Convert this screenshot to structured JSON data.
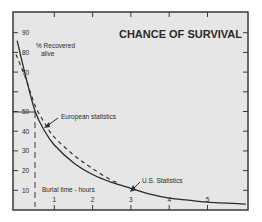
{
  "chart_data": {
    "type": "line",
    "title": "CHANCE OF SURVIVAL",
    "xlabel": "Burial time - hours",
    "ylabel": "% Recovered alive",
    "ylabel_lines": [
      "% Recovered",
      "alive"
    ],
    "xlim": [
      0,
      6
    ],
    "ylim": [
      0,
      100
    ],
    "x_ticks": [
      1,
      2,
      3,
      4,
      5
    ],
    "y_ticks": [
      10,
      20,
      30,
      40,
      50,
      70,
      80,
      90
    ],
    "y_tick_marks": [
      10,
      20,
      30,
      40,
      50,
      60,
      70,
      80,
      90
    ],
    "grid": false,
    "legend_position": "inline annotations",
    "series": [
      {
        "name": "U.S. Statistics",
        "style": "solid",
        "x": [
          0.03,
          0.25,
          0.5,
          0.75,
          1.0,
          1.5,
          2.0,
          2.5,
          3.0,
          3.5,
          4.0,
          4.5,
          5.0,
          6.0
        ],
        "values": [
          86,
          68,
          50,
          40,
          33,
          24,
          18,
          14,
          11,
          8,
          6,
          5,
          4,
          3
        ]
      },
      {
        "name": "European statistics",
        "style": "dashed",
        "x": [
          0.0,
          0.25,
          0.5,
          0.75,
          1.0,
          1.5,
          2.0,
          2.5,
          2.7
        ],
        "values": [
          79,
          67,
          53,
          44,
          37,
          28,
          21,
          15,
          14
        ]
      }
    ],
    "annotations": [
      {
        "text": "European statistics",
        "arrow_to": [
          0.55,
          46
        ]
      },
      {
        "text": "U.S. Statistics",
        "arrow_to": [
          2.8,
          12
        ]
      },
      {
        "text": "Burial time - hours",
        "position": "bottom-left"
      },
      {
        "type": "dashed-vertical-line",
        "x": 0.5
      },
      {
        "type": "horizontal-reference",
        "y": 50,
        "x_to": 0.5
      }
    ],
    "colors": {
      "background": "#e6e6e6",
      "line": "#2a2a2a",
      "frame": "#3a3a3a"
    }
  }
}
